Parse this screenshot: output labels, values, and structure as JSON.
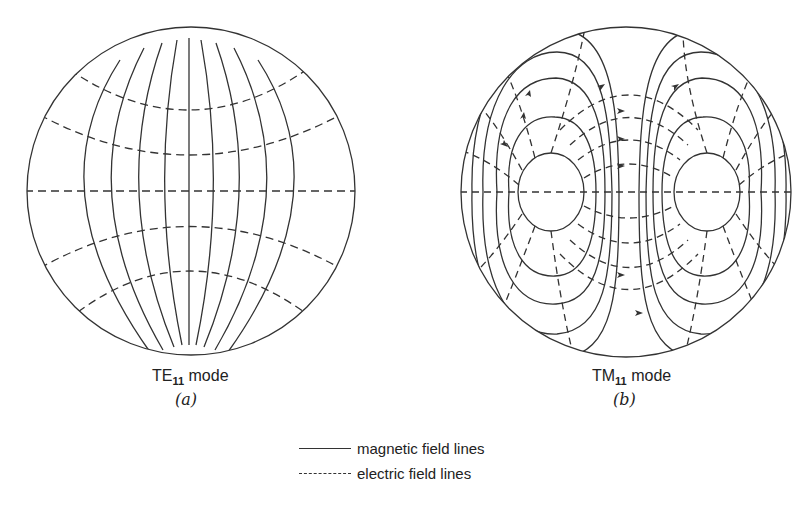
{
  "figure": {
    "panel_a": {
      "caption_prefix": "TE",
      "caption_sub": "11",
      "caption_suffix": " mode",
      "label": "(a)"
    },
    "panel_b": {
      "caption_prefix": "TM",
      "caption_sub": "11",
      "caption_suffix": " mode",
      "label": "(b)"
    },
    "legend": {
      "magnetic": "magnetic field lines",
      "electric": "electric field lines"
    },
    "colors": {
      "line": "#333333",
      "background": "#ffffff"
    }
  }
}
